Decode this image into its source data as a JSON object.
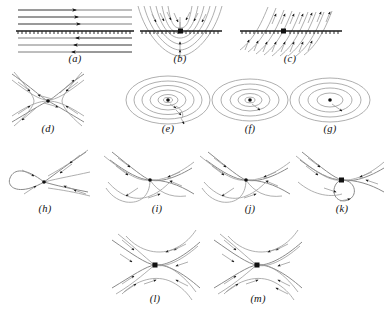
{
  "figure": {
    "type": "phase-portrait-panel-grid",
    "width": 386,
    "height": 317,
    "background_color": "#ffffff",
    "caption_style": "italic parenthesized lowercase letter",
    "panel_count": 13,
    "stroke_colors": {
      "streamline": "#9a9a9a",
      "separatrix": "#8a8a8a",
      "arrow": "#111111",
      "axis": "#1a1a1a",
      "fixed_point": "#111111"
    }
  },
  "rows": [
    {
      "name": "row-1",
      "panels": [
        "a",
        "b",
        "c"
      ]
    },
    {
      "name": "row-2",
      "panels": [
        "d",
        "e",
        "f",
        "g"
      ]
    },
    {
      "name": "row-3",
      "panels": [
        "h",
        "i",
        "j",
        "k"
      ]
    },
    {
      "name": "row-4",
      "panels": [
        "l",
        "m"
      ]
    }
  ],
  "panels": {
    "a": {
      "label": "(a)",
      "label_x": 75,
      "label_y": 60,
      "description": "parallel horizontal streamlines with a hatched invariant line; upper flow rightward, lower flow leftward",
      "streamline_count": 6,
      "arrow_direction_upper": "right",
      "arrow_direction_lower": "left",
      "has_hatched_line": true
    },
    "b": {
      "label": "(b)",
      "label_x": 180,
      "label_y": 60,
      "description": "nested parabolic curves crossing a hatched horizontal line; flow converging toward the line",
      "streamline_count": 7,
      "has_hatched_line": true
    },
    "c": {
      "label": "(c)",
      "label_x": 290,
      "label_y": 60,
      "description": "oblique streamlines crossing a hatched horizontal line, arrows pointing up-right on both sides",
      "streamline_count": 12,
      "has_hatched_line": true
    },
    "d": {
      "label": "(d)",
      "label_x": 48,
      "label_y": 130,
      "description": "saddle point with four hyperbolic branches and two crossing separatrices",
      "fixed_points": 1,
      "fixed_point_type": "saddle"
    },
    "e": {
      "label": "(e)",
      "label_x": 168,
      "label_y": 130,
      "description": "stable spiral focus, trajectories winding inward toward the center",
      "fixed_points": 1,
      "fixed_point_type": "stable-focus",
      "turns": 3
    },
    "f": {
      "label": "(f)",
      "label_x": 250,
      "label_y": 130,
      "description": "spiral focus with fewer windings, trajectory spiralling to the center",
      "fixed_points": 1,
      "fixed_point_type": "focus",
      "turns": 2
    },
    "g": {
      "label": "(g)",
      "label_x": 330,
      "label_y": 130,
      "description": "spiral focus with wide loose windings around the center",
      "fixed_points": 1,
      "fixed_point_type": "focus",
      "turns": 2
    },
    "h": {
      "label": "(h)",
      "label_x": 45,
      "label_y": 210,
      "description": "saddle-node / cusp: a closed lobe on the left meeting a single fixed point with two outgoing branches to the right",
      "fixed_points": 1,
      "fixed_point_type": "saddle-node"
    },
    "i": {
      "label": "(i)",
      "label_x": 157,
      "label_y": 210,
      "description": "saddle with incoming branches from upper left and a large loop returning from below",
      "fixed_points": 1,
      "fixed_point_type": "saddle"
    },
    "j": {
      "label": "(j)",
      "label_x": 250,
      "label_y": 210,
      "description": "saddle with loop below and separatrices entering from upper left and upper right",
      "fixed_points": 1,
      "fixed_point_type": "saddle"
    },
    "k": {
      "label": "(k)",
      "label_x": 342,
      "label_y": 210,
      "description": "saddle with a closed homoclinic loop hanging below the fixed point",
      "fixed_points": 1,
      "fixed_point_type": "saddle",
      "has_homoclinic_loop": true
    },
    "l": {
      "label": "(l)",
      "label_x": 155,
      "label_y": 300,
      "description": "saddle with arcs above and below, arrows converging from upper left and lower right",
      "fixed_points": 1,
      "fixed_point_type": "saddle"
    },
    "m": {
      "label": "(m)",
      "label_x": 258,
      "label_y": 300,
      "description": "saddle with symmetric arcs above and below and four pairs of converging branches",
      "fixed_points": 1,
      "fixed_point_type": "saddle"
    }
  }
}
